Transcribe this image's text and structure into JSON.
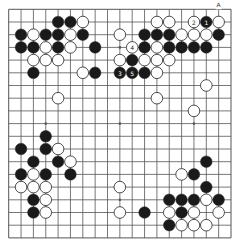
{
  "board": {
    "size": 19,
    "colors": {
      "line": "#555555",
      "black": "#1a1a1a",
      "white": "#ffffff",
      "background": "#ffffff"
    },
    "star_points": [
      [
        3,
        3
      ],
      [
        9,
        3
      ],
      [
        15,
        3
      ],
      [
        3,
        9
      ],
      [
        9,
        9
      ],
      [
        15,
        9
      ],
      [
        3,
        15
      ],
      [
        9,
        15
      ],
      [
        15,
        15
      ]
    ],
    "markers": [
      {
        "col": 17,
        "row": 0,
        "label": "A"
      }
    ],
    "stones": [
      {
        "col": 4,
        "row": 1,
        "color": "black"
      },
      {
        "col": 5,
        "row": 1,
        "color": "black"
      },
      {
        "col": 6,
        "row": 1,
        "color": "white"
      },
      {
        "col": 12,
        "row": 1,
        "color": "white"
      },
      {
        "col": 13,
        "row": 1,
        "color": "white"
      },
      {
        "col": 15,
        "row": 1,
        "color": "white",
        "label": "2"
      },
      {
        "col": 16,
        "row": 1,
        "color": "black",
        "label": "1"
      },
      {
        "col": 17,
        "row": 1,
        "color": "white"
      },
      {
        "col": 1,
        "row": 2,
        "color": "black"
      },
      {
        "col": 2,
        "row": 2,
        "color": "white"
      },
      {
        "col": 3,
        "row": 2,
        "color": "black"
      },
      {
        "col": 4,
        "row": 2,
        "color": "black"
      },
      {
        "col": 5,
        "row": 2,
        "color": "white"
      },
      {
        "col": 6,
        "row": 2,
        "color": "black"
      },
      {
        "col": 9,
        "row": 2,
        "color": "white"
      },
      {
        "col": 11,
        "row": 2,
        "color": "black"
      },
      {
        "col": 12,
        "row": 2,
        "color": "black"
      },
      {
        "col": 13,
        "row": 2,
        "color": "black"
      },
      {
        "col": 14,
        "row": 2,
        "color": "white"
      },
      {
        "col": 15,
        "row": 2,
        "color": "white"
      },
      {
        "col": 16,
        "row": 2,
        "color": "white"
      },
      {
        "col": 17,
        "row": 2,
        "color": "black"
      },
      {
        "col": 1,
        "row": 3,
        "color": "black"
      },
      {
        "col": 2,
        "row": 3,
        "color": "black"
      },
      {
        "col": 3,
        "row": 3,
        "color": "white"
      },
      {
        "col": 4,
        "row": 3,
        "color": "black"
      },
      {
        "col": 5,
        "row": 3,
        "color": "white"
      },
      {
        "col": 7,
        "row": 3,
        "color": "black"
      },
      {
        "col": 10,
        "row": 3,
        "color": "white",
        "label": "4"
      },
      {
        "col": 11,
        "row": 3,
        "color": "black"
      },
      {
        "col": 12,
        "row": 3,
        "color": "white"
      },
      {
        "col": 13,
        "row": 3,
        "color": "black"
      },
      {
        "col": 14,
        "row": 3,
        "color": "black"
      },
      {
        "col": 15,
        "row": 3,
        "color": "black"
      },
      {
        "col": 16,
        "row": 3,
        "color": "black"
      },
      {
        "col": 2,
        "row": 4,
        "color": "white"
      },
      {
        "col": 3,
        "row": 4,
        "color": "white"
      },
      {
        "col": 4,
        "row": 4,
        "color": "white"
      },
      {
        "col": 9,
        "row": 4,
        "color": "white"
      },
      {
        "col": 10,
        "row": 4,
        "color": "black"
      },
      {
        "col": 11,
        "row": 4,
        "color": "white"
      },
      {
        "col": 12,
        "row": 4,
        "color": "white"
      },
      {
        "col": 13,
        "row": 4,
        "color": "white"
      },
      {
        "col": 2,
        "row": 5,
        "color": "black"
      },
      {
        "col": 6,
        "row": 5,
        "color": "white"
      },
      {
        "col": 7,
        "row": 5,
        "color": "black"
      },
      {
        "col": 9,
        "row": 5,
        "color": "black",
        "label": "3"
      },
      {
        "col": 10,
        "row": 5,
        "color": "black",
        "label": "5"
      },
      {
        "col": 11,
        "row": 5,
        "color": "black"
      },
      {
        "col": 12,
        "row": 5,
        "color": "white"
      },
      {
        "col": 16,
        "row": 6,
        "color": "white"
      },
      {
        "col": 4,
        "row": 7,
        "color": "white"
      },
      {
        "col": 12,
        "row": 7,
        "color": "white"
      },
      {
        "col": 15,
        "row": 8,
        "color": "white"
      },
      {
        "col": 3,
        "row": 10,
        "color": "black"
      },
      {
        "col": 1,
        "row": 11,
        "color": "black"
      },
      {
        "col": 3,
        "row": 11,
        "color": "black"
      },
      {
        "col": 4,
        "row": 11,
        "color": "white"
      },
      {
        "col": 2,
        "row": 12,
        "color": "black"
      },
      {
        "col": 4,
        "row": 12,
        "color": "black"
      },
      {
        "col": 5,
        "row": 12,
        "color": "white"
      },
      {
        "col": 16,
        "row": 12,
        "color": "black"
      },
      {
        "col": 1,
        "row": 13,
        "color": "black"
      },
      {
        "col": 2,
        "row": 13,
        "color": "white"
      },
      {
        "col": 3,
        "row": 13,
        "color": "black"
      },
      {
        "col": 5,
        "row": 13,
        "color": "black"
      },
      {
        "col": 14,
        "row": 13,
        "color": "white"
      },
      {
        "col": 15,
        "row": 13,
        "color": "black"
      },
      {
        "col": 1,
        "row": 14,
        "color": "white"
      },
      {
        "col": 2,
        "row": 14,
        "color": "white"
      },
      {
        "col": 3,
        "row": 14,
        "color": "white"
      },
      {
        "col": 9,
        "row": 14,
        "color": "white"
      },
      {
        "col": 16,
        "row": 14,
        "color": "black"
      },
      {
        "col": 2,
        "row": 15,
        "color": "black"
      },
      {
        "col": 3,
        "row": 15,
        "color": "white"
      },
      {
        "col": 13,
        "row": 15,
        "color": "black"
      },
      {
        "col": 14,
        "row": 15,
        "color": "black"
      },
      {
        "col": 15,
        "row": 15,
        "color": "black"
      },
      {
        "col": 16,
        "row": 15,
        "color": "white"
      },
      {
        "col": 17,
        "row": 15,
        "color": "black"
      },
      {
        "col": 2,
        "row": 16,
        "color": "black"
      },
      {
        "col": 3,
        "row": 16,
        "color": "white"
      },
      {
        "col": 9,
        "row": 16,
        "color": "white"
      },
      {
        "col": 11,
        "row": 16,
        "color": "black"
      },
      {
        "col": 13,
        "row": 16,
        "color": "white"
      },
      {
        "col": 14,
        "row": 16,
        "color": "black"
      },
      {
        "col": 15,
        "row": 16,
        "color": "white"
      },
      {
        "col": 17,
        "row": 16,
        "color": "white"
      },
      {
        "col": 13,
        "row": 17,
        "color": "black"
      },
      {
        "col": 14,
        "row": 17,
        "color": "white"
      },
      {
        "col": 15,
        "row": 17,
        "color": "white"
      },
      {
        "col": 16,
        "row": 17,
        "color": "white"
      }
    ]
  }
}
